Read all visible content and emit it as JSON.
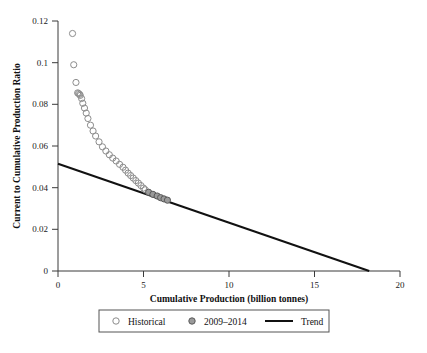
{
  "figure": {
    "caption": ""
  },
  "axes": {
    "xlabel": "Cumulative Production (billion tonnes)",
    "ylabel": "Current to Cumulative Production Ratio",
    "xticklabels": [
      "0",
      "5",
      "10",
      "15",
      "20"
    ],
    "yticklabels": [
      "0",
      "0.02",
      "0.04",
      "0.06",
      "0.08",
      "0.1",
      "0.12"
    ]
  },
  "legend": {
    "historical_label": "Historical",
    "recent_label": "2009–2014",
    "trend_label": "Trend"
  },
  "colors": {
    "open_marker_stroke": "#8c8c8c",
    "filled_marker_fill": "#9a9a9a",
    "filled_marker_stroke": "#5a5a5a",
    "trend_line": "#111111",
    "axis": "#3a3a3a",
    "background": "#ffffff"
  },
  "chart_data": {
    "type": "scatter",
    "title": "",
    "xlabel": "Cumulative Production (billion tonnes)",
    "ylabel": "Current to Cumulative Production Ratio",
    "xlim": [
      0,
      20
    ],
    "ylim": [
      0,
      0.12
    ],
    "xticks": [
      0,
      5,
      10,
      15,
      20
    ],
    "yticks": [
      0,
      0.02,
      0.04,
      0.06,
      0.08,
      0.1,
      0.12
    ],
    "grid": false,
    "legend_position": "below-axes",
    "series": [
      {
        "name": "Historical",
        "marker": "open-circle",
        "x": [
          0.85,
          0.92,
          1.05,
          1.15,
          1.2,
          1.26,
          1.3,
          1.38,
          1.45,
          1.55,
          1.65,
          1.75,
          1.9,
          2.05,
          2.2,
          2.4,
          2.6,
          2.8,
          3.0,
          3.2,
          3.4,
          3.6,
          3.8,
          3.95,
          4.1,
          4.25,
          4.4,
          4.55,
          4.7,
          4.85,
          5.0,
          5.1
        ],
        "y": [
          0.114,
          0.099,
          0.0905,
          0.0855,
          0.0852,
          0.0848,
          0.0843,
          0.0828,
          0.0805,
          0.0782,
          0.0758,
          0.0732,
          0.07,
          0.0672,
          0.0648,
          0.062,
          0.0596,
          0.0576,
          0.0558,
          0.0542,
          0.0528,
          0.0512,
          0.0498,
          0.0484,
          0.047,
          0.0458,
          0.0446,
          0.0434,
          0.0422,
          0.041,
          0.0398,
          0.039
        ]
      },
      {
        "name": "2009–2014",
        "marker": "filled-circle",
        "x": [
          5.3,
          5.55,
          5.8,
          6.0,
          6.2,
          6.4
        ],
        "y": [
          0.0378,
          0.0368,
          0.036,
          0.0352,
          0.0346,
          0.034
        ]
      },
      {
        "name": "Trend",
        "marker": "line",
        "x": [
          0,
          18.2
        ],
        "y": [
          0.0515,
          0.0
        ]
      }
    ]
  }
}
